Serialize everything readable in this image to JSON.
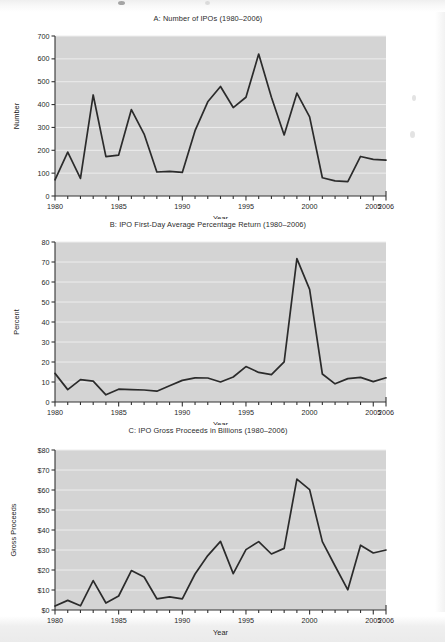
{
  "page": {
    "background_color": "#ffffff",
    "plot_background_color": "#d4d4d4",
    "line_color": "#2b2b2b",
    "gridline_color": "#ededed",
    "axis_color": "#333333"
  },
  "charts": [
    {
      "id": "chart-a",
      "title": "A: Number of IPOs (1980–2006)",
      "chart_data": {
        "type": "line",
        "title": "A: Number of IPOs (1980–2006)",
        "xlabel": "Year",
        "ylabel": "Number",
        "xlim": [
          1980,
          2006
        ],
        "ylim": [
          0,
          700
        ],
        "yticks": [
          0,
          100,
          200,
          300,
          400,
          500,
          600,
          700
        ],
        "ytick_labels": [
          "0",
          "100",
          "200",
          "300",
          "400",
          "500",
          "600",
          "700"
        ],
        "xticks": [
          1980,
          1985,
          1990,
          1995,
          2000,
          2005,
          2006
        ],
        "xtick_labels": [
          "1980",
          "1985",
          "1990",
          "1995",
          "2000",
          "2005",
          "2006"
        ],
        "xminor_step": 1,
        "grid": true,
        "legend": null,
        "x": [
          1980,
          1981,
          1982,
          1983,
          1984,
          1985,
          1986,
          1987,
          1988,
          1989,
          1990,
          1991,
          1992,
          1993,
          1994,
          1995,
          1996,
          1997,
          1998,
          1999,
          2000,
          2001,
          2002,
          2003,
          2004,
          2005,
          2006
        ],
        "values": [
          71,
          192,
          77,
          442,
          172,
          179,
          378,
          271,
          105,
          108,
          103,
          286,
          412,
          479,
          387,
          432,
          621,
          432,
          267,
          450,
          346,
          80,
          66,
          63,
          173,
          160,
          157
        ]
      }
    },
    {
      "id": "chart-b",
      "title": "B: IPO First-Day Average Percentage Return (1980–2006)",
      "chart_data": {
        "type": "line",
        "title": "B: IPO First-Day Average Percentage Return (1980–2006)",
        "xlabel": "Year",
        "ylabel": "Percent",
        "xlim": [
          1980,
          2006
        ],
        "ylim": [
          0,
          80
        ],
        "yticks": [
          0,
          10,
          20,
          30,
          40,
          50,
          60,
          70,
          80
        ],
        "ytick_labels": [
          "0",
          "10",
          "20",
          "30",
          "40",
          "50",
          "60",
          "70",
          "80"
        ],
        "xticks": [
          1980,
          1985,
          1990,
          1995,
          2000,
          2005,
          2006
        ],
        "xtick_labels": [
          "1980",
          "1985",
          "1990",
          "1995",
          "2000",
          "2005",
          "2006"
        ],
        "xminor_step": 1,
        "grid": true,
        "legend": null,
        "x": [
          1980,
          1981,
          1982,
          1983,
          1984,
          1985,
          1986,
          1987,
          1988,
          1989,
          1990,
          1991,
          1992,
          1993,
          1994,
          1995,
          1996,
          1997,
          1998,
          1999,
          2000,
          2001,
          2002,
          2003,
          2004,
          2005,
          2006
        ],
        "values": [
          14.3,
          6.2,
          11.2,
          10.4,
          3.6,
          6.4,
          6.2,
          6.0,
          5.4,
          8.1,
          10.8,
          12.1,
          12.0,
          10.0,
          12.5,
          17.7,
          14.8,
          13.7,
          20.1,
          71.7,
          56.3,
          14.0,
          9.1,
          11.7,
          12.3,
          10.2,
          12.1
        ]
      }
    },
    {
      "id": "chart-c",
      "title": "C: IPO Gross Proceeds in Billions (1980–2006)",
      "chart_data": {
        "type": "line",
        "title": "C: IPO Gross Proceeds in Billions (1980–2006)",
        "xlabel": "Year",
        "ylabel": "Gross Proceeds",
        "xlim": [
          1980,
          2006
        ],
        "ylim": [
          0,
          80
        ],
        "yticks": [
          0,
          10,
          20,
          30,
          40,
          50,
          60,
          70,
          80
        ],
        "ytick_labels": [
          "$0",
          "$10",
          "$20",
          "$30",
          "$40",
          "$50",
          "$60",
          "$70",
          "$80"
        ],
        "xticks": [
          1980,
          1985,
          1990,
          1995,
          2000,
          2005,
          2006
        ],
        "xtick_labels": [
          "1980",
          "1985",
          "1990",
          "1995",
          "2000",
          "2005",
          "2006"
        ],
        "xminor_step": 1,
        "grid": true,
        "legend": null,
        "units": "billions of dollars",
        "x": [
          1980,
          1981,
          1982,
          1983,
          1984,
          1985,
          1986,
          1987,
          1988,
          1989,
          1990,
          1991,
          1992,
          1993,
          1994,
          1995,
          1996,
          1997,
          1998,
          1999,
          2000,
          2001,
          2002,
          2003,
          2004,
          2005,
          2006
        ],
        "values": [
          2.0,
          4.8,
          2.1,
          14.7,
          3.5,
          7.0,
          19.7,
          16.5,
          5.6,
          6.6,
          5.6,
          18.0,
          27.2,
          34.3,
          18.2,
          30.2,
          34.2,
          28.0,
          30.8,
          65.4,
          60.2,
          34.2,
          22.0,
          10.1,
          32.4,
          28.5,
          30.0
        ]
      }
    }
  ]
}
